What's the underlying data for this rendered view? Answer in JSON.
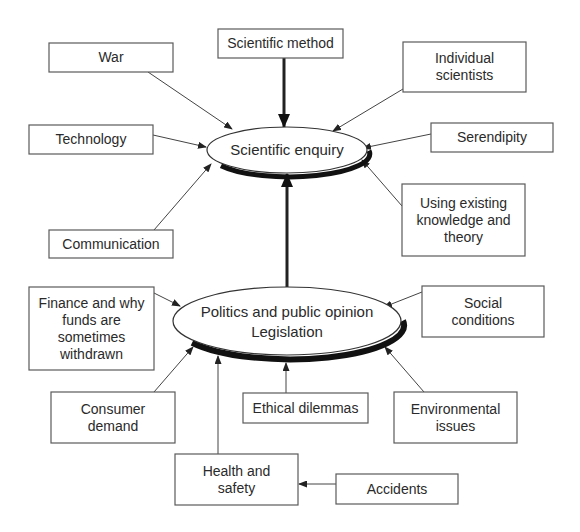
{
  "diagram": {
    "center_top": {
      "label": "Scientific enquiry",
      "cx": 287,
      "cy": 150,
      "rx": 80,
      "ry": 23
    },
    "center_bottom": {
      "lines": [
        "Politics and public opinion",
        "Legislation"
      ],
      "cx": 287,
      "cy": 321,
      "rx": 114,
      "ry": 34
    },
    "top_factors": [
      {
        "id": "war",
        "lines": [
          "War"
        ],
        "x": 49,
        "y": 43,
        "w": 124,
        "h": 29,
        "from": [
          148,
          72
        ],
        "to": [
          232,
          129
        ]
      },
      {
        "id": "scientific-method",
        "lines": [
          "Scientific method"
        ],
        "x": 218,
        "y": 29,
        "w": 125,
        "h": 29,
        "from": [
          284,
          58
        ],
        "to": [
          284,
          127
        ],
        "thick": true
      },
      {
        "id": "individual-scientists",
        "lines": [
          "Individual",
          "scientists"
        ],
        "x": 403,
        "y": 42,
        "w": 123,
        "h": 50,
        "from": [
          403,
          89
        ],
        "to": [
          333,
          131
        ]
      },
      {
        "id": "technology",
        "lines": [
          "Technology"
        ],
        "x": 29,
        "y": 125,
        "w": 124,
        "h": 29,
        "from": [
          153,
          135
        ],
        "to": [
          206,
          147
        ]
      },
      {
        "id": "serendipity",
        "lines": [
          "Serendipity"
        ],
        "x": 431,
        "y": 123,
        "w": 122,
        "h": 29,
        "from": [
          431,
          134
        ],
        "to": [
          363,
          148
        ]
      },
      {
        "id": "communication",
        "lines": [
          "Communication"
        ],
        "x": 49,
        "y": 230,
        "w": 124,
        "h": 28,
        "from": [
          154,
          230
        ],
        "to": [
          211,
          164
        ]
      },
      {
        "id": "existing-knowledge",
        "lines": [
          "Using existing",
          "knowledge and",
          "theory"
        ],
        "x": 402,
        "y": 184,
        "w": 123,
        "h": 72,
        "from": [
          402,
          206
        ],
        "to": [
          362,
          160
        ]
      }
    ],
    "bottom_factors": [
      {
        "id": "finance",
        "lines": [
          "Finance and why",
          "funds are",
          "sometimes",
          "withdrawn"
        ],
        "x": 29,
        "y": 287,
        "w": 125,
        "h": 83,
        "from": [
          154,
          293
        ],
        "to": [
          180,
          306
        ]
      },
      {
        "id": "social-conditions",
        "lines": [
          "Social",
          "conditions"
        ],
        "x": 422,
        "y": 286,
        "w": 122,
        "h": 51,
        "from": [
          422,
          292
        ],
        "to": [
          384,
          307
        ]
      },
      {
        "id": "consumer-demand",
        "lines": [
          "Consumer",
          "demand"
        ],
        "x": 51,
        "y": 392,
        "w": 124,
        "h": 51,
        "from": [
          154,
          392
        ],
        "to": [
          193,
          347
        ]
      },
      {
        "id": "ethical-dilemmas",
        "lines": [
          "Ethical dilemmas"
        ],
        "x": 243,
        "y": 393,
        "w": 125,
        "h": 30,
        "from": [
          286,
          393
        ],
        "to": [
          286,
          363
        ]
      },
      {
        "id": "environmental-issues",
        "lines": [
          "Environmental",
          "issues"
        ],
        "x": 394,
        "y": 392,
        "w": 123,
        "h": 51,
        "from": [
          424,
          392
        ],
        "to": [
          385,
          347
        ]
      },
      {
        "id": "health-safety",
        "lines": [
          "Health and",
          "safety"
        ],
        "x": 175,
        "y": 454,
        "w": 123,
        "h": 51,
        "from": [
          218,
          454
        ],
        "to": [
          218,
          356
        ]
      }
    ],
    "secondary_factors": [
      {
        "id": "accidents",
        "lines": [
          "Accidents"
        ],
        "x": 336,
        "y": 474,
        "w": 122,
        "h": 30,
        "from": [
          336,
          484
        ],
        "to": [
          299,
          484
        ]
      }
    ],
    "main_link": {
      "from": [
        287,
        287
      ],
      "to": [
        287,
        174
      ],
      "thick": true
    }
  }
}
